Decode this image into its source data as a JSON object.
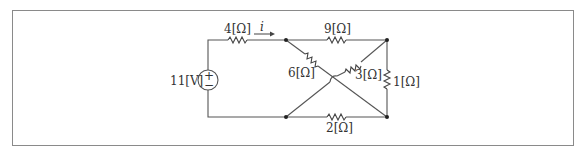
{
  "circuit": {
    "source": {
      "label": "11[V]",
      "plus": "+",
      "minus": "−",
      "type": "voltage-source"
    },
    "current": {
      "label": "i"
    },
    "resistors": [
      {
        "id": "r_series",
        "label": "4[Ω]"
      },
      {
        "id": "r_top",
        "label": "9[Ω]"
      },
      {
        "id": "r_diag_left",
        "label": "6[Ω]"
      },
      {
        "id": "r_diag_right",
        "label": "3[Ω]"
      },
      {
        "id": "r_right",
        "label": "1[Ω]"
      },
      {
        "id": "r_bottom",
        "label": "2[Ω]"
      }
    ]
  },
  "colors": {
    "wire": "#555555",
    "border": "#8a8a8a",
    "text": "#333333"
  }
}
